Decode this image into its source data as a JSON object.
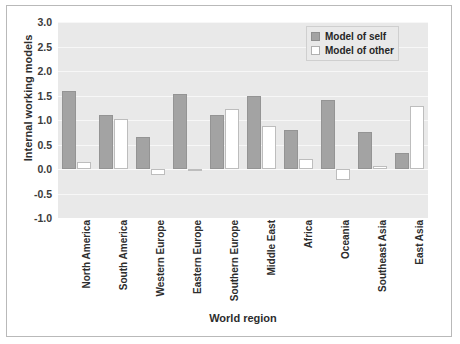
{
  "chart_data": {
    "type": "bar",
    "title": "",
    "xlabel": "World region",
    "ylabel": "Internal working models",
    "ylim": [
      -1.0,
      3.0
    ],
    "ytick_labels": [
      "3.0",
      "2.5",
      "2.0",
      "1.5",
      "1.0",
      "0.5",
      "0.0",
      "-0.5",
      "-1.0"
    ],
    "yticks": [
      3.0,
      2.5,
      2.0,
      1.5,
      1.0,
      0.5,
      0.0,
      -0.5,
      -1.0
    ],
    "grid": true,
    "legend_position": "top-right",
    "categories": [
      "North America",
      "South America",
      "Western Europe",
      "Eastern Europe",
      "Southern Europe",
      "Middle East",
      "Africa",
      "Oceania",
      "Southeast Asia",
      "East Asia"
    ],
    "series": [
      {
        "name": "Model of self",
        "color": "#a3a3a3",
        "values": [
          1.6,
          1.11,
          0.65,
          1.53,
          1.1,
          1.5,
          0.8,
          1.4,
          0.75,
          0.32
        ]
      },
      {
        "name": "Model of other",
        "color": "#ffffff",
        "values": [
          0.15,
          1.02,
          -0.12,
          0.0,
          1.22,
          0.88,
          0.2,
          -0.22,
          0.07,
          1.28
        ]
      }
    ]
  },
  "legend": {
    "items": [
      {
        "label": "Model of self"
      },
      {
        "label": "Model of other"
      }
    ]
  },
  "colors": {
    "self_fill": "#a3a3a3",
    "other_fill": "#ffffff",
    "plot_background": "#e9e9e9",
    "gridline": "#f7f7f7",
    "text": "#2d2d2d"
  }
}
